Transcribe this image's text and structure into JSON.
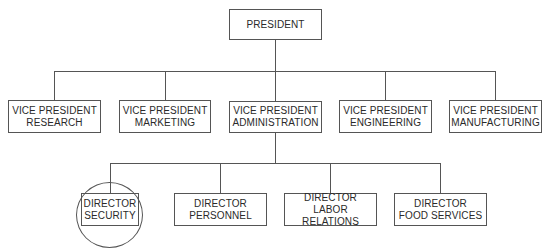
{
  "chart": {
    "root": {
      "title": "PRESIDENT"
    },
    "vice_presidents": [
      {
        "line1": "VICE PRESIDENT",
        "line2": "RESEARCH"
      },
      {
        "line1": "VICE PRESIDENT",
        "line2": "MARKETING"
      },
      {
        "line1": "VICE PRESIDENT",
        "line2": "ADMINISTRATION"
      },
      {
        "line1": "VICE PRESIDENT",
        "line2": "ENGINEERING"
      },
      {
        "line1": "VICE PRESIDENT",
        "line2": "MANUFACTURING"
      }
    ],
    "directors": [
      {
        "line1": "DIRECTOR",
        "line2": "SECURITY",
        "highlighted": true
      },
      {
        "line1": "DIRECTOR",
        "line2": "PERSONNEL"
      },
      {
        "line1": "DIRECTOR",
        "line2": "LABOR RELATIONS"
      },
      {
        "line1": "DIRECTOR",
        "line2": "FOOD SERVICES"
      }
    ]
  },
  "colors": {
    "line": "#555555",
    "text": "#2a2a2a",
    "background": "#ffffff"
  }
}
